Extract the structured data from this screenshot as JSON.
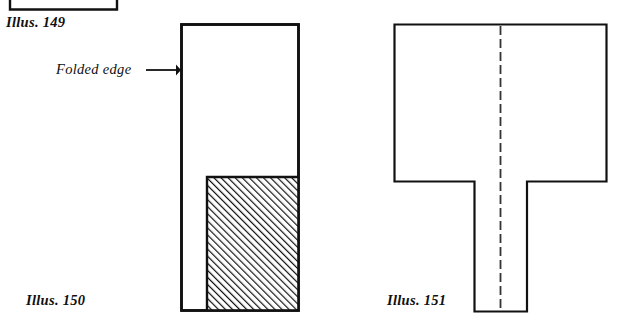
{
  "page": {
    "width": 624,
    "height": 325,
    "background_color": "#ffffff",
    "ink_color": "#111111"
  },
  "labels": {
    "illus_149": "Illus. 149",
    "illus_150": "Illus. 150",
    "illus_151": "Illus. 151",
    "folded_edge": "Folded edge"
  },
  "figures": [
    {
      "id": "illus-149",
      "caption": "Illus. 149",
      "shape": "partial-rectangle-cropped-at-top",
      "stroke_color": "#111111",
      "stroke_width": 2.2,
      "bounds": {
        "x": 10,
        "y": -20,
        "width": 108,
        "height": 30
      }
    },
    {
      "id": "illus-150",
      "caption": "Illus. 150",
      "shape": "tall-rectangle-with-hatched-lower-inset-block",
      "stroke_color": "#111111",
      "stroke_width": 2.6,
      "outer": {
        "x": 181,
        "y": 24,
        "width": 118,
        "height": 287
      },
      "hatched_region": {
        "x": 207,
        "y": 177,
        "width": 92,
        "height": 134
      },
      "hatch": {
        "angle_degrees": 45,
        "direction": "bottom-left-to-top-right",
        "spacing": 5,
        "line_width": 2,
        "color": "#111111"
      },
      "annotation": {
        "text": "Folded edge",
        "arrow_points_to": "left edge of rectangle",
        "arrow_y": 70,
        "arrow_x_start": 146,
        "arrow_x_end": 180
      }
    },
    {
      "id": "illus-151",
      "caption": "Illus. 151",
      "shape": "inverted-T",
      "stroke_color": "#111111",
      "stroke_width": 2.2,
      "top_bar": {
        "x": 394,
        "y": 24,
        "width": 213,
        "height": 158
      },
      "stem": {
        "x": 474,
        "y": 182,
        "width": 53,
        "height": 130
      },
      "center_fold_line": {
        "style": "dashed",
        "x": 500,
        "y_start": 26,
        "y_end": 311,
        "dash_length": 9,
        "gap_length": 4,
        "line_width": 1.6,
        "color": "#333333"
      }
    }
  ]
}
